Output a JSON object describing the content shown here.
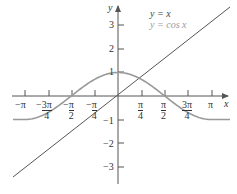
{
  "chart_data": {
    "type": "line",
    "title": "",
    "xlabel": "x",
    "ylabel": "y",
    "x_ticks": [
      "-π",
      "-3π/4",
      "-π/2",
      "-π/4",
      "π/4",
      "π/2",
      "3π/4",
      "π"
    ],
    "y_ticks": [
      "3",
      "2",
      "1",
      "-1",
      "-2",
      "-3"
    ],
    "xlim": [
      -3.3,
      3.3
    ],
    "ylim": [
      -3.5,
      3.8
    ],
    "grid": false,
    "legend_position": "top-right",
    "series": [
      {
        "name": "y = x",
        "color": "#555555",
        "function": "x"
      },
      {
        "name": "y = cos x",
        "color": "#999999",
        "function": "cos(x)"
      }
    ]
  },
  "legend": {
    "line": "y = x",
    "cos": "y = cos x"
  },
  "axes": {
    "x": "x",
    "y": "y"
  },
  "xticks": {
    "t0": "−π",
    "t1n": "3π",
    "t1d": "4",
    "t2n": "π",
    "t2d": "2",
    "t3n": "π",
    "t3d": "4",
    "t4n": "π",
    "t4d": "4",
    "t5n": "π",
    "t5d": "2",
    "t6n": "3π",
    "t6d": "4",
    "t7": "π"
  },
  "yticks": {
    "p3": "3",
    "p2": "2",
    "p1": "1",
    "m1": "−1",
    "m2": "−2",
    "m3": "−3"
  }
}
